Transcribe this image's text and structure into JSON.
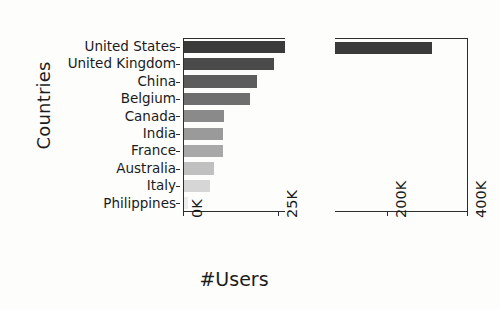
{
  "chart_data": {
    "type": "bar",
    "orientation": "horizontal",
    "title": "",
    "xlabel": "#Users",
    "ylabel": "Countries",
    "broken_axis": true,
    "grid": false,
    "legend": "none",
    "categories": [
      "United States",
      "United Kingdom",
      "China",
      "Belgium",
      "Canada",
      "India",
      "France",
      "Australia",
      "Italy",
      "Philippines"
    ],
    "values": [
      312000,
      23700,
      19200,
      17400,
      10500,
      10300,
      10200,
      7900,
      6800,
      1000
    ],
    "bar_colors": [
      "#3a3a3a",
      "#4a4a4a",
      "#5c5c5c",
      "#6e6e6e",
      "#8a8a8a",
      "#9a9a9a",
      "#a8a8a8",
      "#c0c0c0",
      "#d6d6d6",
      "#ededed"
    ],
    "panels": [
      {
        "name": "left-panel",
        "xlim": [
          0,
          26800
        ],
        "ticks": [
          {
            "value": 0,
            "label": "0K"
          },
          {
            "value": 25000,
            "label": "25K"
          }
        ]
      },
      {
        "name": "right-panel",
        "xlim": [
          70000,
          402000
        ],
        "ticks": [
          {
            "value": 200000,
            "label": "200K"
          },
          {
            "value": 400000,
            "label": "400K"
          }
        ]
      }
    ]
  },
  "axis": {
    "ylabel": "Countries",
    "xlabel": "#Users",
    "left_ticks": [
      "0K",
      "25K"
    ],
    "right_ticks": [
      "200K",
      "400K"
    ]
  },
  "categories": [
    {
      "label": "United States"
    },
    {
      "label": "United Kingdom"
    },
    {
      "label": "China"
    },
    {
      "label": "Belgium"
    },
    {
      "label": "Canada"
    },
    {
      "label": "India"
    },
    {
      "label": "France"
    },
    {
      "label": "Australia"
    },
    {
      "label": "Italy"
    },
    {
      "label": "Philippines"
    }
  ],
  "colors": {
    "axis": "#2c2c2c",
    "text": "#1b1b1b",
    "background": "#fdfdfc",
    "bar_darkest": "#3a3a3a",
    "bar_lightest": "#ededed"
  }
}
